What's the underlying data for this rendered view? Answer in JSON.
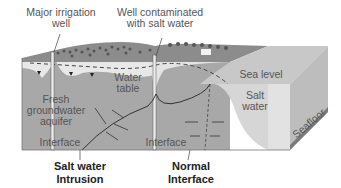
{
  "diagram": {
    "labels": {
      "irrigation_well": [
        "Major irrigation",
        "well"
      ],
      "contaminated_well": [
        "Well contaminated",
        "with salt water"
      ],
      "water_table": [
        "Water",
        "table"
      ],
      "sea_level": "Sea level",
      "salt_water": [
        "Salt",
        "water"
      ],
      "fresh_aquifer": [
        "Fresh",
        "groundwater",
        "aquifer"
      ],
      "interface_left": "Interface",
      "interface_right": "Interface",
      "seafloor": "Seafloor",
      "salt_water_intrusion": [
        "Salt water",
        "Intrusion"
      ],
      "normal_interface": [
        "Normal",
        "Interface"
      ]
    },
    "colors": {
      "ground_surface": "#8c8c8c",
      "vegetation": "#555555",
      "unsaturated_zone": "#e6e6e6",
      "fresh_groundwater": "#a8a8a8",
      "salt_water": "#d2d2d2",
      "sea_surface": "#c4c4c4",
      "box_side": "#9a9a9a",
      "seafloor_strip": "#7a7a7a",
      "text": "#555555",
      "bold_text": "#222222"
    }
  }
}
